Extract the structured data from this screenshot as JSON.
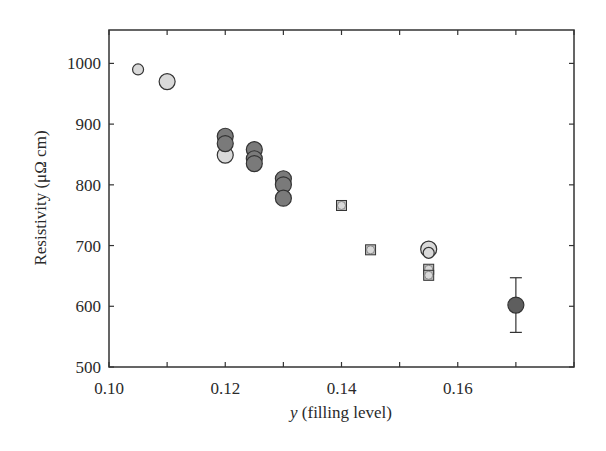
{
  "chart_data": {
    "type": "scatter",
    "title": "",
    "xlabel": "y (filling level)",
    "xlabel_italic_part": "y",
    "xlabel_rest": " (filling level)",
    "ylabel": "Resistivity (μΩ cm)",
    "xlim": [
      0.1,
      0.18
    ],
    "ylim": [
      500,
      1055
    ],
    "xticks": [
      0.1,
      0.12,
      0.14,
      0.16
    ],
    "xtick_labels": [
      "0.10",
      "0.12",
      "0.14",
      "0.16"
    ],
    "xminor_ticks": [
      0.11,
      0.13,
      0.15,
      0.17
    ],
    "yticks": [
      500,
      600,
      700,
      800,
      900,
      1000
    ],
    "ytick_labels": [
      "500",
      "600",
      "700",
      "800",
      "900",
      "1000"
    ],
    "grid": false,
    "legend": null,
    "colors": {
      "light": "#d9d9d9",
      "dark": "#7a7a7a",
      "darkest": "#5e5e5e",
      "edge": "#333333"
    },
    "points": [
      {
        "x": 0.105,
        "y": 990,
        "size": "small",
        "marker": "circle",
        "fill": "light"
      },
      {
        "x": 0.11,
        "y": 970,
        "size": "large",
        "marker": "circle",
        "fill": "light"
      },
      {
        "x": 0.12,
        "y": 849,
        "size": "large",
        "marker": "circle",
        "fill": "light"
      },
      {
        "x": 0.12,
        "y": 880,
        "size": "large",
        "marker": "circle",
        "fill": "dark"
      },
      {
        "x": 0.12,
        "y": 868,
        "size": "large",
        "marker": "circle",
        "fill": "dark"
      },
      {
        "x": 0.125,
        "y": 858,
        "size": "large",
        "marker": "circle",
        "fill": "dark"
      },
      {
        "x": 0.125,
        "y": 843,
        "size": "large",
        "marker": "circle",
        "fill": "dark"
      },
      {
        "x": 0.125,
        "y": 835,
        "size": "large",
        "marker": "circle",
        "fill": "dark"
      },
      {
        "x": 0.13,
        "y": 810,
        "size": "large",
        "marker": "circle",
        "fill": "dark"
      },
      {
        "x": 0.13,
        "y": 800,
        "size": "large",
        "marker": "circle",
        "fill": "dark"
      },
      {
        "x": 0.13,
        "y": 778,
        "size": "large",
        "marker": "circle",
        "fill": "dark"
      },
      {
        "x": 0.14,
        "y": 766,
        "size": "small",
        "marker": "square-circle",
        "fill": "light"
      },
      {
        "x": 0.145,
        "y": 693,
        "size": "small",
        "marker": "square-circle",
        "fill": "light"
      },
      {
        "x": 0.155,
        "y": 694,
        "size": "large",
        "marker": "circle",
        "fill": "light"
      },
      {
        "x": 0.155,
        "y": 688,
        "size": "small",
        "marker": "circle",
        "fill": "light"
      },
      {
        "x": 0.155,
        "y": 661,
        "size": "small",
        "marker": "square-circle",
        "fill": "light"
      },
      {
        "x": 0.155,
        "y": 651,
        "size": "small",
        "marker": "square-circle",
        "fill": "light"
      },
      {
        "x": 0.17,
        "y": 602,
        "size": "large",
        "marker": "circle",
        "fill": "darkest",
        "error": [
          557,
          647
        ]
      }
    ]
  }
}
